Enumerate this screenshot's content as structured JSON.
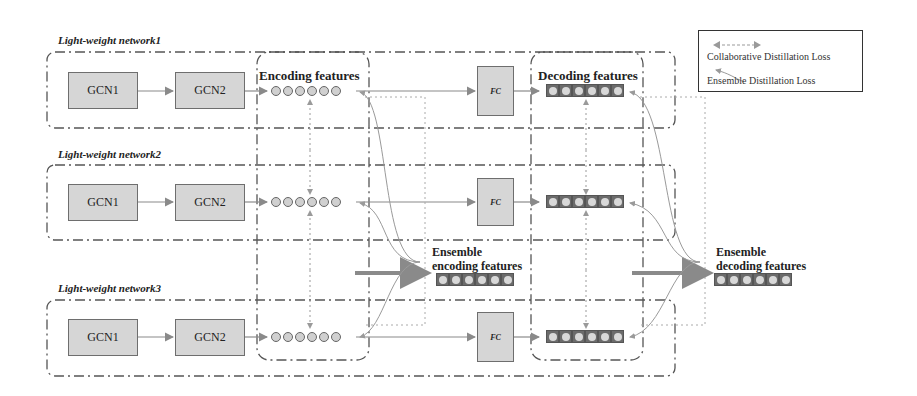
{
  "networks": [
    {
      "title": "Light-weight network1",
      "gcn1": "GCN1",
      "gcn2": "GCN2",
      "fc": "FC"
    },
    {
      "title": "Light-weight network2",
      "gcn1": "GCN1",
      "gcn2": "GCN2",
      "fc": "FC"
    },
    {
      "title": "Light-weight network3",
      "gcn1": "GCN1",
      "gcn2": "GCN2",
      "fc": "FC"
    }
  ],
  "labels": {
    "encoding_features": "Encoding features",
    "decoding_features": "Decoding features",
    "ensemble_encoding_line1": "Ensemble",
    "ensemble_encoding_line2": "encoding features",
    "ensemble_decoding_line1": "Ensemble",
    "ensemble_decoding_line2": "decoding features"
  },
  "legend": {
    "collaborative": "Collaborative Distillation Loss",
    "ensemble": "Ensemble Distillation Loss"
  },
  "colors": {
    "box_fill": "#d6d6d6",
    "arrow_gray": "#8a8a8a",
    "border_dark": "#555555"
  }
}
